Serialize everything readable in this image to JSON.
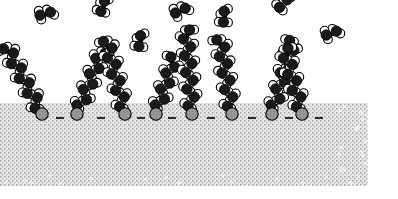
{
  "figure": {
    "type": "space-filling molecular model",
    "caption": "",
    "background_color": "#ffffff"
  },
  "colors": {
    "carbon": "#1a1a1a",
    "hydrogen": "#ffffff",
    "atom_outline": "#000000",
    "sulfur_head": "#9a9a9a",
    "sulfur_head_dark": "#7d7d7d",
    "substrate_fill": "#e8e8e8",
    "substrate_stipple": "#9d9d9d",
    "bond_dash": "#2b2b2b"
  },
  "substrate": {
    "label": "substrate",
    "x": 0,
    "y": 103,
    "width": 368,
    "height": 83,
    "texture": "stipple"
  },
  "legend": {
    "carbon_label": "carbon",
    "hydrogen_label": "hydrogen",
    "sulfur_label": "sulfur head group",
    "substrate_label": "substrate"
  },
  "counts": {
    "anchored_chains": 8,
    "free_fragments": 7,
    "bond_dashes": 8
  },
  "anchored_chains": [
    {
      "id": "chain-1",
      "head_x": 42,
      "head_y": 114,
      "angle_deg": -28,
      "units": 9,
      "tilt_label": "tilted"
    },
    {
      "id": "chain-2",
      "head_x": 77,
      "head_y": 114,
      "angle_deg": 22,
      "units": 8,
      "tilt_label": "tilted"
    },
    {
      "id": "chain-3",
      "head_x": 125,
      "head_y": 114,
      "angle_deg": -14,
      "units": 9,
      "tilt_label": "tilted"
    },
    {
      "id": "chain-4",
      "head_x": 156,
      "head_y": 114,
      "angle_deg": 18,
      "units": 7,
      "tilt_label": "tilted"
    },
    {
      "id": "chain-5",
      "head_x": 192,
      "head_y": 114,
      "angle_deg": -4,
      "units": 10,
      "tilt_label": "upright"
    },
    {
      "id": "chain-6",
      "head_x": 232,
      "head_y": 114,
      "angle_deg": -9,
      "units": 9,
      "tilt_label": "upright"
    },
    {
      "id": "chain-7",
      "head_x": 272,
      "head_y": 114,
      "angle_deg": 16,
      "units": 9,
      "tilt_label": "tilted"
    },
    {
      "id": "chain-8",
      "head_x": 302,
      "head_y": 114,
      "angle_deg": -15,
      "units": 8,
      "tilt_label": "tilted"
    }
  ],
  "bond_dashes": [
    {
      "x": 60,
      "y": 118
    },
    {
      "x": 101,
      "y": 118
    },
    {
      "x": 141,
      "y": 118
    },
    {
      "x": 172,
      "y": 118
    },
    {
      "x": 211,
      "y": 118
    },
    {
      "x": 252,
      "y": 118
    },
    {
      "x": 289,
      "y": 118
    },
    {
      "x": 319,
      "y": 118
    }
  ],
  "free_fragments": [
    {
      "id": "fragment-1",
      "x": 38,
      "y": 24,
      "angle_deg": 35,
      "units": 2
    },
    {
      "id": "fragment-2",
      "x": 107,
      "y": 18,
      "angle_deg": -20,
      "units": 2
    },
    {
      "id": "fragment-3",
      "x": 175,
      "y": 22,
      "angle_deg": 25,
      "units": 2
    },
    {
      "id": "fragment-4",
      "x": 231,
      "y": 27,
      "angle_deg": -35,
      "units": 2
    },
    {
      "id": "fragment-5",
      "x": 282,
      "y": 16,
      "angle_deg": 6,
      "units": 3
    },
    {
      "id": "fragment-6",
      "x": 325,
      "y": 44,
      "angle_deg": 30,
      "units": 2
    },
    {
      "id": "fragment-7",
      "x": 146,
      "y": 52,
      "angle_deg": -30,
      "units": 2
    }
  ]
}
